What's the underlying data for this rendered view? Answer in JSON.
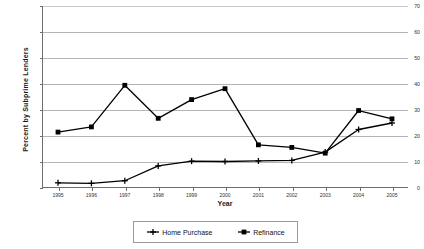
{
  "chart_data": {
    "type": "line",
    "title": "",
    "xlabel": "Year",
    "ylabel": "Percent by Subprime Lenders",
    "categories": [
      "1995",
      "1996",
      "1997",
      "1998",
      "1999",
      "2000",
      "2001",
      "2002",
      "2003",
      "2004",
      "2005"
    ],
    "x": [
      1995,
      1996,
      1997,
      1998,
      1999,
      2000,
      2001,
      2002,
      2003,
      2004,
      2005
    ],
    "ylim": [
      0,
      70
    ],
    "yticks": [
      0,
      10,
      20,
      30,
      40,
      50,
      60,
      70
    ],
    "ytick_labels": [
      "0",
      "10",
      "20",
      "30",
      "40",
      "50",
      "60",
      "70"
    ],
    "grid": true,
    "legend_position": "bottom",
    "series": [
      {
        "name": "Home Purchase",
        "marker": "plus",
        "color": "#000000",
        "values": [
          2.0,
          1.8,
          2.8,
          8.5,
          10.3,
          10.2,
          10.4,
          10.6,
          13.8,
          22.5,
          25.0
        ]
      },
      {
        "name": "Refinance",
        "marker": "square",
        "color": "#000000",
        "values": [
          21.5,
          23.5,
          39.5,
          26.8,
          34.0,
          38.2,
          16.6,
          15.6,
          13.4,
          29.8,
          26.6
        ]
      }
    ]
  },
  "legend": {
    "items": [
      {
        "label": "Home Purchase",
        "marker": "plus"
      },
      {
        "label": "Refinance",
        "marker": "square"
      }
    ]
  },
  "axes": {
    "y_title": "Percent by Subprime Lenders",
    "x_title": "Year"
  }
}
